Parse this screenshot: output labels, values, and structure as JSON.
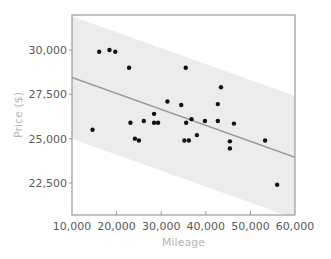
{
  "chart_data": {
    "type": "scatter",
    "title": "",
    "xlabel": "Mileage",
    "ylabel": "Price ($)",
    "xlim": [
      10000,
      60000
    ],
    "ylim": [
      21000,
      31700
    ],
    "x_ticks": [
      10000,
      20000,
      30000,
      40000,
      50000,
      60000
    ],
    "x_tick_labels": [
      "10,000",
      "20,000",
      "30,000",
      "40,000",
      "50,000",
      "60,000"
    ],
    "y_ticks": [
      22500,
      25000,
      27500,
      30000
    ],
    "y_tick_labels": [
      "22,500",
      "25,000",
      "27,500",
      "30,000"
    ],
    "grid": false,
    "legend": null,
    "series": [
      {
        "name": "Cars",
        "marker": "dot",
        "color": "#111111",
        "points": [
          [
            14600,
            25500
          ],
          [
            16100,
            29900
          ],
          [
            18400,
            30000
          ],
          [
            19700,
            29900
          ],
          [
            22800,
            29000
          ],
          [
            23100,
            25900
          ],
          [
            24100,
            25000
          ],
          [
            25000,
            24900
          ],
          [
            26100,
            26000
          ],
          [
            28400,
            26400
          ],
          [
            28400,
            25900
          ],
          [
            29300,
            25900
          ],
          [
            31400,
            27100
          ],
          [
            34500,
            26900
          ],
          [
            35500,
            29000
          ],
          [
            35200,
            24900
          ],
          [
            35600,
            25900
          ],
          [
            36200,
            24900
          ],
          [
            36800,
            26100
          ],
          [
            38000,
            25200
          ],
          [
            39800,
            26000
          ],
          [
            42700,
            26950
          ],
          [
            43400,
            27900
          ],
          [
            42700,
            26000
          ],
          [
            46300,
            25850
          ],
          [
            45400,
            24850
          ],
          [
            45400,
            24450
          ],
          [
            53300,
            24900
          ],
          [
            56000,
            22400
          ]
        ]
      }
    ],
    "regression_line": {
      "color": "#9a9a9a",
      "points": [
        [
          10000,
          28450
        ],
        [
          60000,
          23950
        ]
      ]
    },
    "prediction_band": {
      "color": "#ececec",
      "half_width": 3450
    }
  },
  "colors": {
    "frame": "#9a9a9a",
    "band": "#ececec",
    "line": "#9a9a9a",
    "point": "#111111",
    "tick_label": "#5a5a5a",
    "axis_title": "#b8b8b8"
  }
}
